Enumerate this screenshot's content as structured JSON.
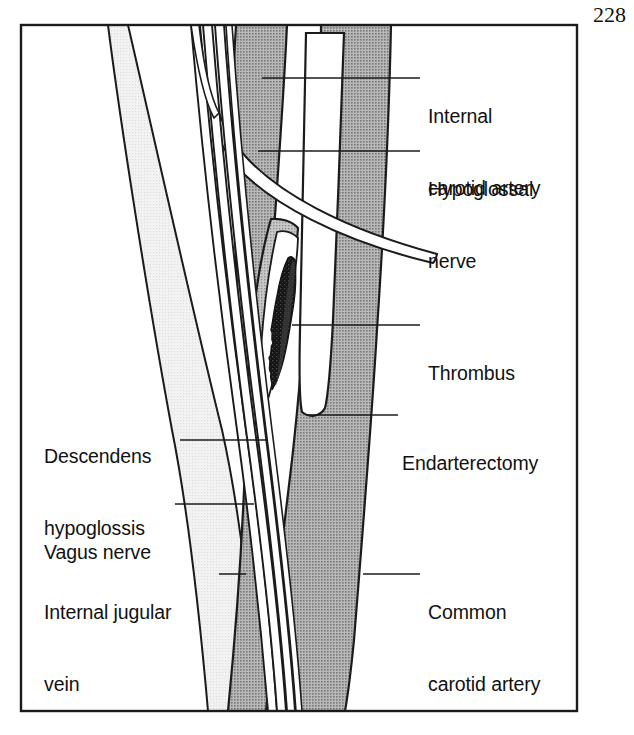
{
  "figure": {
    "page_number": "228",
    "frame": {
      "x": 20,
      "y": 24,
      "width": 558,
      "height": 688,
      "stroke": "#1b1b1b",
      "stroke_width": 2.4
    }
  },
  "palette": {
    "background": "#ffffff",
    "artery_grey": "#9c9c9c",
    "artery_grey_light": "#b0b0b0",
    "vein_light_grey": "#ededed",
    "thrombus_dark": "#181818",
    "thrombus_mid": "#3a3a3a",
    "outline": "#1b1b1b",
    "text": "#111111",
    "leader": "#1b1b1b"
  },
  "labels": [
    {
      "id": "internal-carotid-artery",
      "text_lines": [
        "Internal",
        "carotid artery"
      ],
      "line1": "Internal",
      "line2": "carotid artery",
      "side": "right",
      "x": 428,
      "y": 56,
      "leader": {
        "x1": 262,
        "y1": 78,
        "x2": 420,
        "y2": 78
      }
    },
    {
      "id": "hypoglossal-nerve",
      "text_lines": [
        "Hypoglossal",
        "nerve"
      ],
      "line1": "Hypoglossal",
      "line2": "nerve",
      "side": "right",
      "x": 428,
      "y": 129,
      "leader": {
        "x1": 258,
        "y1": 151,
        "x2": 420,
        "y2": 151
      }
    },
    {
      "id": "thrombus",
      "text_lines": [
        "Thrombus"
      ],
      "line1": "Thrombus",
      "line2": "",
      "side": "right",
      "x": 428,
      "y": 313,
      "leader": {
        "x1": 292,
        "y1": 325,
        "x2": 420,
        "y2": 325
      }
    },
    {
      "id": "endarterectomy",
      "text_lines": [
        "Endarterectomy"
      ],
      "line1": "Endarterectomy",
      "line2": "",
      "side": "right",
      "x": 402,
      "y": 403,
      "leader": {
        "x1": 306,
        "y1": 415,
        "x2": 398,
        "y2": 415
      }
    },
    {
      "id": "common-carotid-artery",
      "text_lines": [
        "Common",
        "carotid artery"
      ],
      "line1": "Common",
      "line2": "carotid artery",
      "side": "right",
      "x": 428,
      "y": 552,
      "leader": {
        "x1": 363,
        "y1": 574,
        "x2": 420,
        "y2": 574
      }
    },
    {
      "id": "descendens-hypoglossis",
      "text_lines": [
        "Descendens",
        "hypoglossis"
      ],
      "line1": "Descendens",
      "line2": "hypoglossis",
      "side": "left",
      "x": 44,
      "y": 396,
      "leader": {
        "x1": 180,
        "y1": 440,
        "x2": 268,
        "y2": 440
      }
    },
    {
      "id": "vagus-nerve",
      "text_lines": [
        "Vagus nerve"
      ],
      "line1": "Vagus nerve",
      "line2": "",
      "side": "left",
      "x": 44,
      "y": 492,
      "leader": {
        "x1": 175,
        "y1": 504,
        "x2": 254,
        "y2": 504
      }
    },
    {
      "id": "internal-jugular-vein",
      "text_lines": [
        "Internal jugular",
        "vein"
      ],
      "line1": "Internal jugular",
      "line2": "vein",
      "side": "left",
      "x": 44,
      "y": 552,
      "leader": {
        "x1": 219,
        "y1": 574,
        "x2": 246,
        "y2": 574
      }
    }
  ],
  "structures": [
    {
      "id": "internal-carotid-artery",
      "name": "Internal carotid artery",
      "fill": "artery_grey"
    },
    {
      "id": "common-carotid-artery",
      "name": "Common carotid artery",
      "fill": "artery_grey"
    },
    {
      "id": "internal-jugular-vein",
      "name": "Internal jugular vein",
      "fill": "vein_light_grey"
    },
    {
      "id": "hypoglossal-nerve",
      "name": "Hypoglossal nerve",
      "fill": "background"
    },
    {
      "id": "descendens-hypoglossis",
      "name": "Descendens hypoglossis",
      "fill": "background"
    },
    {
      "id": "vagus-nerve",
      "name": "Vagus nerve",
      "fill": "background"
    },
    {
      "id": "thrombus",
      "name": "Thrombus",
      "fill": "thrombus_dark"
    },
    {
      "id": "endarterectomy",
      "name": "Endarterectomy incision",
      "fill": "background"
    }
  ]
}
